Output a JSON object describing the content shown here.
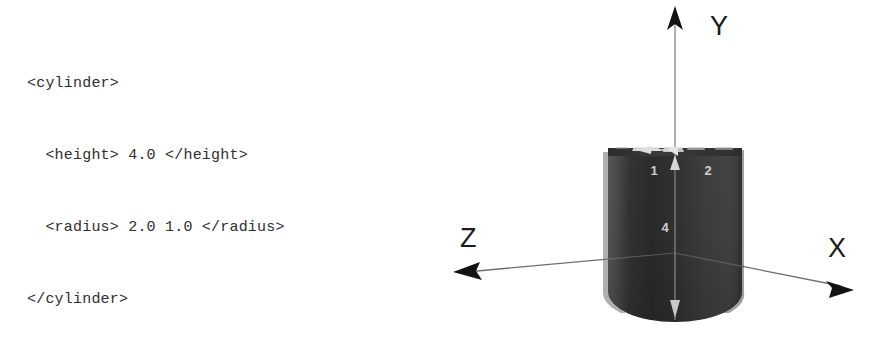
{
  "background_color": "#ffffff",
  "code_block": {
    "language": "xml",
    "text_color": "#2e2e2e",
    "lines": [
      "<cylinder>",
      "  <height> 4.0 </height>",
      "  <radius> 2.0 1.0 </radius>",
      "</cylinder>"
    ]
  },
  "figure": {
    "kind": "3d-wireframe-solid",
    "shape": "elliptical-cylinder",
    "body_color": "#3a3a3a",
    "body_color_light": "#6d6d6d",
    "body_color_dark": "#232323",
    "axis_color": "#6f6f6f",
    "arrow_color": "#111111",
    "dim_arrow_color": "#d8d8d8",
    "axes": [
      {
        "name": "y-axis",
        "label": "Y",
        "direction": "up"
      },
      {
        "name": "x-axis",
        "label": "X",
        "direction": "down-right"
      },
      {
        "name": "z-axis",
        "label": "Z",
        "direction": "down-left"
      }
    ],
    "dimension_labels": [
      {
        "name": "radius-z-label",
        "value": "1"
      },
      {
        "name": "radius-x-label",
        "value": "2"
      },
      {
        "name": "height-label",
        "value": "4"
      }
    ]
  }
}
